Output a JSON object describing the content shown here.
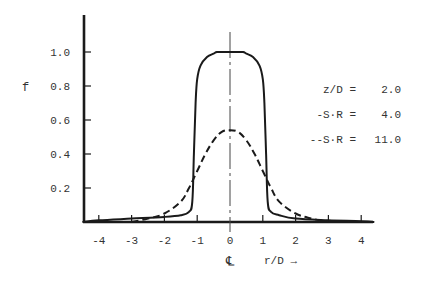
{
  "chart_data": {
    "type": "line",
    "title": "",
    "xlabel": "r/D →",
    "ylabel": "f",
    "centerline_label": "℄",
    "xlim": [
      -4.5,
      4.4
    ],
    "ylim": [
      0,
      1.2
    ],
    "grid": false,
    "x_ticks": [
      -4,
      -3,
      -2,
      -1,
      0,
      1,
      2,
      3,
      4
    ],
    "x_tick_labels": [
      "-4",
      "-3",
      "-2",
      "-1",
      "0",
      "1",
      "2",
      "3",
      "4"
    ],
    "y_ticks": [
      0.2,
      0.4,
      0.6,
      0.8,
      1.0
    ],
    "y_tick_labels": [
      "0.2",
      "0.4",
      "0.6",
      "0.8",
      "1.0"
    ],
    "annotations": [
      {
        "label": "z/D =",
        "value": "2.0"
      },
      {
        "label": "-S·R =",
        "value": "4.0"
      },
      {
        "label": "--S·R =",
        "value": "11.0"
      }
    ],
    "legend_position": "right",
    "series": [
      {
        "name": "S·R = 4.0",
        "style": "solid",
        "x": [
          -4.5,
          -4.0,
          -3.0,
          -2.0,
          -1.5,
          -1.25,
          -1.15,
          -1.1,
          -1.05,
          -1.0,
          -0.9,
          -0.7,
          -0.5,
          -0.4,
          -0.2,
          0.0,
          0.2,
          0.4,
          0.5,
          0.7,
          0.9,
          1.0,
          1.05,
          1.1,
          1.15,
          1.25,
          1.5,
          2.0,
          3.0,
          4.0,
          4.4
        ],
        "y": [
          0.0,
          0.01,
          0.02,
          0.03,
          0.04,
          0.06,
          0.12,
          0.4,
          0.7,
          0.84,
          0.92,
          0.97,
          0.99,
          1.0,
          1.0,
          1.0,
          1.0,
          1.0,
          0.99,
          0.97,
          0.92,
          0.84,
          0.7,
          0.4,
          0.12,
          0.06,
          0.04,
          0.02,
          0.01,
          0.005,
          0.0
        ]
      },
      {
        "name": "S·R = 11.0",
        "style": "dashed",
        "x": [
          -3.0,
          -2.5,
          -2.0,
          -1.5,
          -1.25,
          -1.0,
          -0.75,
          -0.5,
          -0.25,
          0.0,
          0.25,
          0.5,
          0.75,
          1.0,
          1.25,
          1.5,
          2.0,
          2.5,
          3.0
        ],
        "y": [
          0.0,
          0.02,
          0.05,
          0.12,
          0.2,
          0.3,
          0.4,
          0.48,
          0.53,
          0.54,
          0.53,
          0.48,
          0.4,
          0.3,
          0.2,
          0.12,
          0.05,
          0.02,
          0.0
        ]
      }
    ]
  },
  "colors": {
    "ink": "#1a1a1a",
    "text": "#333333",
    "background": "#ffffff"
  }
}
